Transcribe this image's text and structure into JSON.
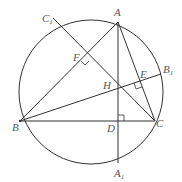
{
  "diagram": {
    "type": "geometry",
    "colors": {
      "stroke": "#333333",
      "label": "#555555",
      "background": "#ffffff"
    },
    "circle": {
      "cx": 91,
      "cy": 92,
      "r": 72
    },
    "points": {
      "A": {
        "label": "A",
        "sub": "",
        "x": 118,
        "y": 22
      },
      "B": {
        "label": "B",
        "sub": "",
        "x": 20,
        "y": 121
      },
      "C": {
        "label": "C",
        "sub": "",
        "x": 155,
        "y": 121
      },
      "D": {
        "label": "D",
        "sub": "",
        "x": 118,
        "y": 121
      },
      "E": {
        "label": "E",
        "sub": "",
        "x": 140,
        "y": 81
      },
      "F": {
        "label": "F",
        "sub": "",
        "x": 85,
        "y": 57
      },
      "H": {
        "label": "H",
        "sub": "",
        "x": 118,
        "y": 87
      },
      "A1": {
        "label": "A",
        "sub": "1",
        "x": 118,
        "y": 163
      },
      "B1": {
        "label": "B",
        "sub": "1",
        "x": 161,
        "y": 74
      },
      "C1": {
        "label": "C",
        "sub": "1",
        "x": 53,
        "y": 18
      }
    },
    "segments": [
      [
        "A",
        "B"
      ],
      [
        "A",
        "C"
      ],
      [
        "B",
        "C"
      ],
      [
        "A",
        "A1"
      ],
      [
        "B",
        "B1"
      ],
      [
        "C",
        "C1"
      ]
    ],
    "right_angles": [
      "D",
      "E",
      "F"
    ]
  }
}
